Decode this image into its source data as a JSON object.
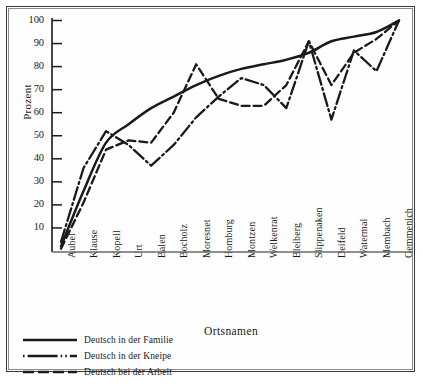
{
  "chart_data": {
    "type": "line",
    "title": "",
    "xlabel": "Ortsnamen",
    "ylabel": "Prozent",
    "ylim": [
      0,
      100
    ],
    "yticks": [
      0,
      10,
      20,
      30,
      40,
      50,
      60,
      70,
      80,
      90,
      100
    ],
    "ytick_labels": [
      "",
      "10",
      "20",
      "30",
      "40",
      "50",
      "60",
      "70",
      "80",
      "90",
      "100"
    ],
    "grid": false,
    "legend_position": "below-left",
    "categories": [
      "Aubel",
      "Klause",
      "Kopell",
      "Urt",
      "Balen",
      "Bocholz",
      "Moresnet",
      "Homburg",
      "Montzen",
      "Welkenrat",
      "Bleiberg",
      "Slippenaken",
      "Deifeld",
      "Watermal",
      "Membach",
      "Gemmenich"
    ],
    "series": [
      {
        "name": "Deutsch in der Familie",
        "style": "solid",
        "values": [
          2,
          26,
          47,
          55,
          62,
          67,
          72,
          76,
          79,
          81,
          83,
          86,
          91,
          93,
          95,
          100
        ]
      },
      {
        "name": "Deutsch in der Kneipe",
        "style": "dash-dot",
        "values": [
          4,
          36,
          52,
          46,
          37,
          46,
          58,
          67,
          75,
          72,
          62,
          91,
          57,
          87,
          78,
          100
        ]
      },
      {
        "name": "Deutsch bei der Arbeit",
        "style": "dashed",
        "values": [
          1,
          21,
          44,
          48,
          47,
          60,
          81,
          66,
          63,
          63,
          72,
          91,
          72,
          86,
          92,
          100
        ]
      }
    ]
  },
  "ytick_labels": {
    "t100": "100",
    "t90": "90",
    "t80": "80",
    "t70": "70",
    "t60": "60",
    "t50": "50",
    "t40": "40",
    "t30": "30",
    "t20": "20",
    "t10": "10"
  },
  "axis_titles": {
    "y": "Prozent",
    "x": "Ortsnamen"
  },
  "xcats": {
    "c0": "Aubel",
    "c1": "Klause",
    "c2": "Kopell",
    "c3": "Urt",
    "c4": "Balen",
    "c5": "Bocholz",
    "c6": "Moresnet",
    "c7": "Homburg",
    "c8": "Montzen",
    "c9": "Welkenrat",
    "c10": "Bleiberg",
    "c11": "Slippenaken",
    "c12": "Deifeld",
    "c13": "Watermal",
    "c14": "Membach",
    "c15": "Gemmenich"
  },
  "legend": {
    "items": [
      {
        "label": "Deutsch in der Familie",
        "style": "solid"
      },
      {
        "label": "Deutsch in der Kneipe",
        "style": "dash-dot"
      },
      {
        "label": "Deutsch bei der Arbeit",
        "style": "dashed"
      }
    ]
  },
  "colors": {
    "ink": "#1a1a1a",
    "frame_outer": "#3a3a3a",
    "frame_inner": "#8a8a8a",
    "background": "#ffffff"
  }
}
